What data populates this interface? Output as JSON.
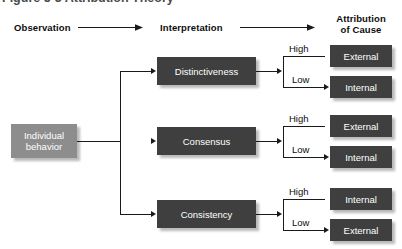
{
  "title": "Figure 5-3  Attribution Theory",
  "headers": {
    "observation": "Observation",
    "interpretation": "Interpretation",
    "attribution_line1": "Attribution",
    "attribution_line2": "of Cause"
  },
  "source": {
    "label_line1": "Individual",
    "label_line2": "behavior"
  },
  "branch_labels": {
    "high": "High",
    "low": "Low"
  },
  "criteria": [
    {
      "label": "Distinctiveness",
      "high_outcome": "External",
      "low_outcome": "Internal"
    },
    {
      "label": "Consensus",
      "high_outcome": "External",
      "low_outcome": "Internal"
    },
    {
      "label": "Consistency",
      "high_outcome": "Internal",
      "low_outcome": "External"
    }
  ],
  "colors": {
    "box_dark": "#3f3f3f",
    "box_light": "#8d8d8d",
    "line": "#1a1a1a",
    "text_on_box": "#ffffff",
    "heading": "#0d0d0d"
  }
}
